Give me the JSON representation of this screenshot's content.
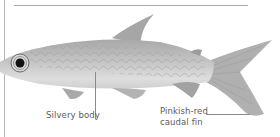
{
  "figure": {
    "colors": {
      "body": "#c9c9c9",
      "body_dark": "#9e9e9e",
      "fin": "#a9a9a9",
      "eye": "#111111",
      "rule": "#a8a8a8",
      "label_text": "#5a5a5a"
    }
  },
  "annotations": {
    "body": "Silvery body",
    "fin_line1": "Pinkish-red",
    "fin_line2": "caudal fin"
  }
}
